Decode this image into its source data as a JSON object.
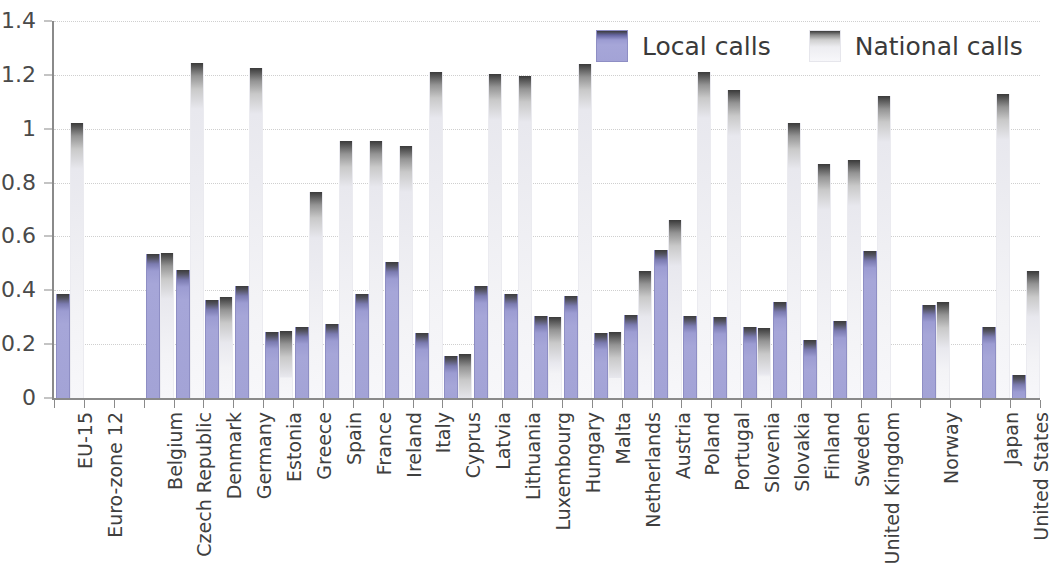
{
  "legend": {
    "position": "top-right",
    "entries": [
      {
        "label": "Local calls",
        "color": "#a3a3d6",
        "icon": "local-calls-swatch"
      },
      {
        "label": "National calls",
        "color": "#f5f5f8",
        "icon": "national-calls-swatch"
      }
    ]
  },
  "chart_data": {
    "type": "bar",
    "title": "",
    "subtitle": "",
    "xlabel": "",
    "ylabel": "",
    "ylim": [
      0,
      1.4
    ],
    "yticks": [
      0,
      0.2,
      0.4,
      0.6,
      0.8,
      1,
      1.2,
      1.4
    ],
    "ytick_labels": [
      "0",
      "0.2",
      "0.4",
      "0.6",
      "0.8",
      "1",
      "1.2",
      "1.4"
    ],
    "grid": true,
    "grid_axis": "y",
    "legend_position": "top-right",
    "categories": [
      "EU-15",
      "Euro-zone 12",
      "",
      "Belgium",
      "Czech Republic",
      "Denmark",
      "Germany",
      "Estonia",
      "Greece",
      "Spain",
      "France",
      "Ireland",
      "Italy",
      "Cyprus",
      "Latvia",
      "Lithuania",
      "Luxembourg",
      "Hungary",
      "Malta",
      "Netherlands",
      "Austria",
      "Poland",
      "Portugal",
      "Slovenia",
      "Slovakia",
      "Finland",
      "Sweden",
      "United Kingdom",
      "",
      "Norway",
      "",
      "Japan",
      "United States"
    ],
    "series": [
      {
        "name": "Local calls",
        "color": "#a3a3d6",
        "values": [
          0.385,
          null,
          null,
          0.535,
          0.475,
          0.365,
          0.415,
          0.245,
          0.265,
          0.275,
          0.385,
          0.505,
          0.24,
          0.155,
          0.415,
          0.385,
          0.305,
          0.38,
          0.24,
          0.31,
          0.55,
          0.305,
          0.3,
          0.265,
          0.355,
          0.215,
          0.285,
          0.545,
          null,
          0.345,
          null,
          0.265,
          0.085
        ]
      },
      {
        "name": "National calls",
        "color": "#f5f5f8",
        "values": [
          1.02,
          null,
          null,
          0.54,
          1.245,
          0.375,
          1.225,
          0.25,
          0.765,
          0.955,
          0.955,
          0.935,
          1.21,
          0.165,
          1.205,
          1.195,
          0.3,
          1.24,
          0.245,
          0.47,
          0.66,
          1.21,
          1.145,
          0.26,
          1.02,
          0.87,
          0.885,
          1.12,
          null,
          0.355,
          null,
          1.13,
          0.47
        ]
      }
    ]
  }
}
